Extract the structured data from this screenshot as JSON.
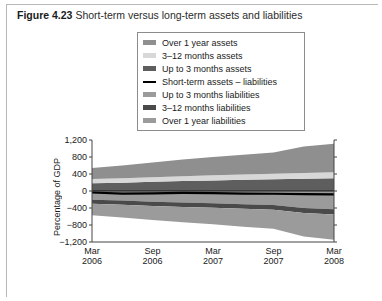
{
  "figure": {
    "number": "Figure 4.23",
    "title": "Short-term versus long-term assets and liabilities"
  },
  "legend": {
    "position": "top-center",
    "items": [
      {
        "label": "Over 1 year assets",
        "color": "#8f8f8f",
        "type": "band"
      },
      {
        "label": "3–12 months assets",
        "color": "#d8d8d8",
        "type": "band"
      },
      {
        "label": "Up to 3 months assets",
        "color": "#5e5e5e",
        "type": "band"
      },
      {
        "label": "Short-term assets – liabilities",
        "color": "#000000",
        "type": "line"
      },
      {
        "label": "Up to 3 months liabilities",
        "color": "#9b9b9b",
        "type": "band"
      },
      {
        "label": "3–12 months liabilities",
        "color": "#4a4a4a",
        "type": "band"
      },
      {
        "label": "Over 1 year liabilities",
        "color": "#9b9b9b",
        "type": "band"
      }
    ]
  },
  "caption_bottom": "",
  "chart_data": {
    "type": "area",
    "title": "Short-term versus long-term assets and liabilities",
    "xlabel": "",
    "ylabel": "Percentage of GDP",
    "ylim": [
      -1200,
      1200
    ],
    "yticks": [
      1200,
      800,
      400,
      0,
      -400,
      -800,
      -1200
    ],
    "ytick_labels": [
      "1,200",
      "800",
      "400",
      "0",
      "−400",
      "−800",
      "−1,200"
    ],
    "grid": false,
    "legend_position": "above-plot",
    "x": [
      "Mar 2006",
      "Jun 2006",
      "Sep 2006",
      "Dec 2006",
      "Mar 2007",
      "Jun 2007",
      "Sep 2007",
      "Dec 2007",
      "Mar 2008"
    ],
    "xtick_labels": [
      {
        "line1": "Mar",
        "line2": "2006"
      },
      {
        "line1": "Sep",
        "line2": "2006"
      },
      {
        "line1": "Mar",
        "line2": "2007"
      },
      {
        "line1": "Sep",
        "line2": "2007"
      },
      {
        "line1": "Mar",
        "line2": "2008"
      }
    ],
    "series": [
      {
        "name": "Up to 3 months assets",
        "color": "#5e5e5e",
        "side": "assets",
        "stack_order": 1,
        "values": [
          180,
          195,
          215,
          235,
          250,
          265,
          275,
          290,
          300
        ]
      },
      {
        "name": "3–12 months assets",
        "color": "#d8d8d8",
        "side": "assets",
        "stack_order": 2,
        "values": [
          100,
          105,
          110,
          115,
          120,
          125,
          130,
          135,
          140
        ]
      },
      {
        "name": "Over 1 year assets",
        "color": "#8f8f8f",
        "side": "assets",
        "stack_order": 3,
        "values": [
          260,
          300,
          345,
          390,
          430,
          465,
          500,
          620,
          670
        ]
      },
      {
        "name": "Up to 3 months liabilities",
        "color": "#9b9b9b",
        "side": "liabilities",
        "stack_order": 1,
        "values": [
          -205,
          -225,
          -250,
          -270,
          -290,
          -310,
          -330,
          -400,
          -430
        ]
      },
      {
        "name": "3–12 months liabilities",
        "color": "#4a4a4a",
        "side": "liabilities",
        "stack_order": 2,
        "values": [
          -95,
          -100,
          -100,
          -105,
          -105,
          -110,
          -110,
          -120,
          -125
        ]
      },
      {
        "name": "Over 1 year liabilities",
        "color": "#9b9b9b",
        "side": "liabilities",
        "stack_order": 3,
        "values": [
          -270,
          -300,
          -330,
          -360,
          -390,
          -420,
          -450,
          -550,
          -590
        ]
      }
    ],
    "net_line": {
      "name": "Short-term assets – liabilities",
      "color": "#000000",
      "values": [
        -35,
        -60,
        -55,
        -45,
        -50,
        -60,
        -65,
        -75,
        -80
      ]
    }
  }
}
